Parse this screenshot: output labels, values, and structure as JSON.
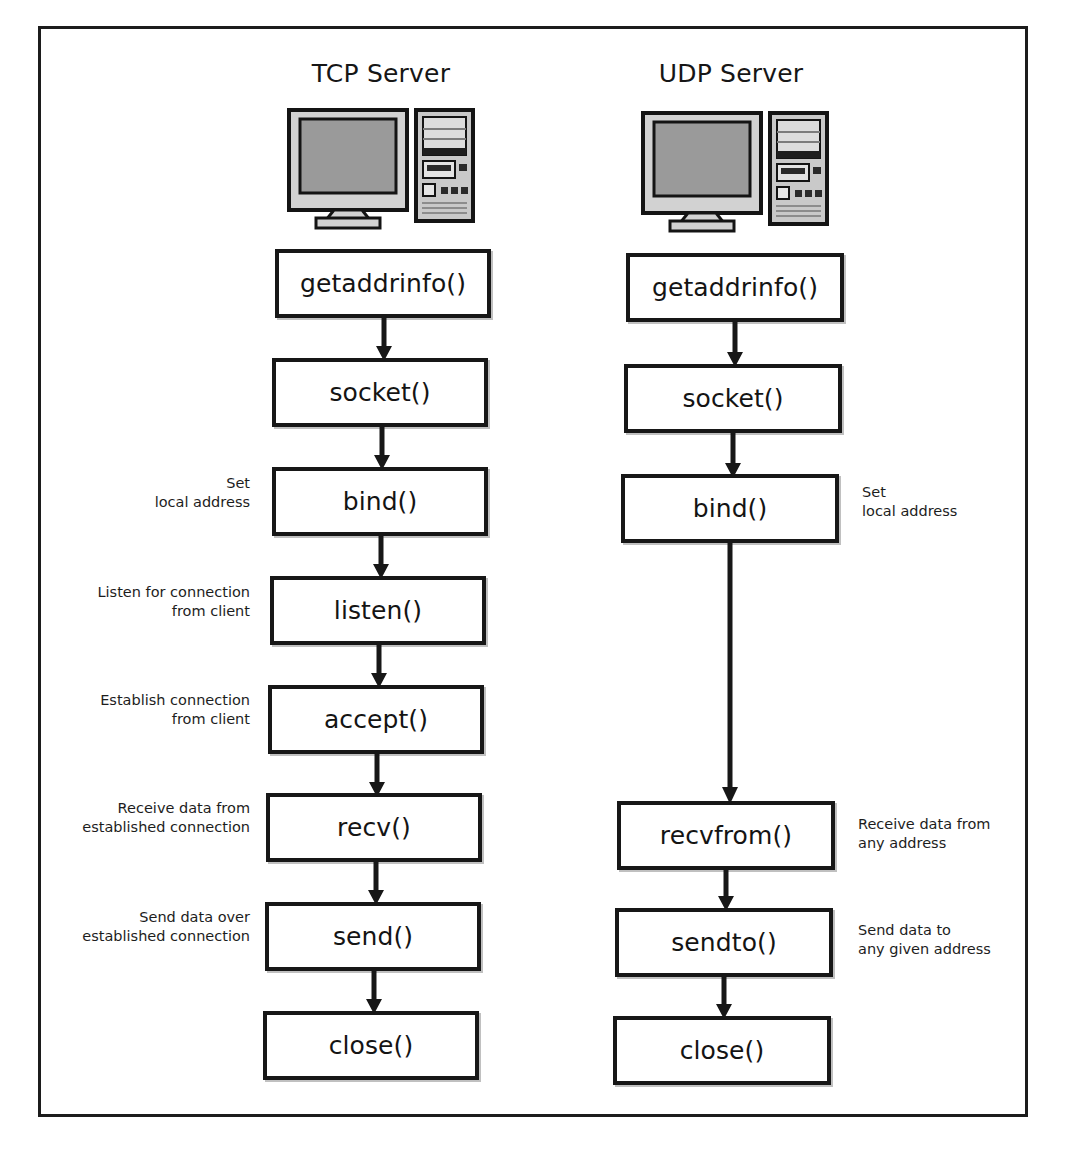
{
  "diagram": {
    "type": "flowchart",
    "title_tcp": "TCP Server",
    "title_udp": "UDP Server",
    "icon_tcp": "desktop-computer-icon",
    "icon_udp": "desktop-computer-icon",
    "frame_color": "#1c1c1c",
    "box_border_color": "#171717",
    "box_fill_color": "#ffffff",
    "arrow_color": "#171717",
    "screen_gray": "#999999",
    "tower_gray": "#b5b5b5"
  },
  "tcp_column": {
    "heading": "TCP Server",
    "steps": [
      {
        "label": "getaddrinfo()",
        "note": ""
      },
      {
        "label": "socket()",
        "note": ""
      },
      {
        "label": "bind()",
        "note": "Set\nlocal address"
      },
      {
        "label": "listen()",
        "note": "Listen for connection\nfrom client"
      },
      {
        "label": "accept()",
        "note": "Establish connection\nfrom client"
      },
      {
        "label": "recv()",
        "note": "Receive data from\nestablished connection"
      },
      {
        "label": "send()",
        "note": "Send data over\nestablished connection"
      },
      {
        "label": "close()",
        "note": ""
      }
    ]
  },
  "udp_column": {
    "heading": "UDP Server",
    "steps": [
      {
        "label": "getaddrinfo()",
        "note": ""
      },
      {
        "label": "socket()",
        "note": ""
      },
      {
        "label": "bind()",
        "note": "Set\nlocal address"
      },
      {
        "label": "recvfrom()",
        "note": "Receive data from\nany address"
      },
      {
        "label": "sendto()",
        "note": "Send data to\nany given address"
      },
      {
        "label": "close()",
        "note": ""
      }
    ]
  }
}
